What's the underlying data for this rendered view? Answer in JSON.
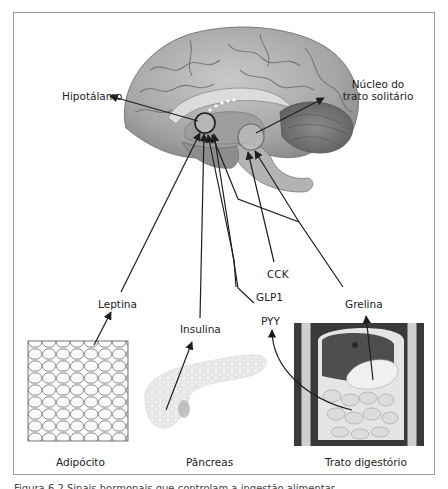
{
  "figure": {
    "labels": {
      "hypothalamus": "Hipotálamo",
      "nucleus_line1": "Núcleo do",
      "nucleus_line2": "trato solitário",
      "leptin": "Leptina",
      "insulin": "Insulina",
      "cck": "CCK",
      "glp1": "GLP1",
      "pyy": "PYY",
      "ghrelin": "Grelina"
    },
    "organs": {
      "adipocyte": "Adipócito",
      "pancreas": "Pâncreas",
      "digestive_tract": "Trato digestório"
    },
    "caption": "Figura 6.2 Sinais hormonais que controlam a ingestão alimentar"
  },
  "colors": {
    "frame": "#9a9a9a",
    "line": "#1e1e1e",
    "brain_light": "#b8b8b8",
    "brain_dark": "#6e6e6e"
  }
}
